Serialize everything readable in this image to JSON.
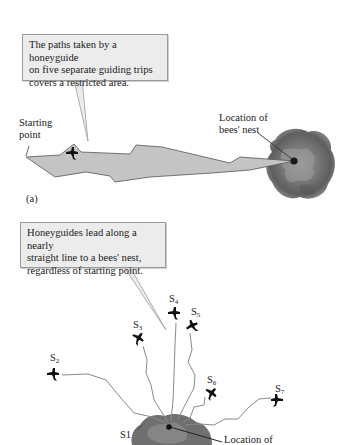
{
  "panel_a": {
    "callout_text": [
      "The paths taken by a honeyguide",
      "on five separate guiding trips",
      "covers a restricted area."
    ],
    "starting_point_label": [
      "Starting",
      "point"
    ],
    "nest_label": [
      "Location of",
      "bees' nest"
    ],
    "panel_label": "(a)"
  },
  "panel_b": {
    "callout_text": [
      "Honeyguides lead along a nearly",
      "straight line to a bees' nest,",
      "regardless of starting point."
    ],
    "start_labels": [
      {
        "id": "S1",
        "base": "S1",
        "sub": ""
      },
      {
        "id": "S2",
        "base": "S",
        "sub": "2"
      },
      {
        "id": "S3",
        "base": "S",
        "sub": "3"
      },
      {
        "id": "S4",
        "base": "S",
        "sub": "4"
      },
      {
        "id": "S5",
        "base": "S",
        "sub": "5"
      },
      {
        "id": "S6",
        "base": "S",
        "sub": "6"
      },
      {
        "id": "S7",
        "base": "S",
        "sub": "7"
      }
    ],
    "nest_label": "Location of"
  },
  "colors": {
    "callout_bg": "#ececec",
    "area_fill": "#c4c4c4",
    "path_stroke": "#8a8a8a",
    "nest_gray": "#6e6e6e",
    "bird": "#111111"
  }
}
